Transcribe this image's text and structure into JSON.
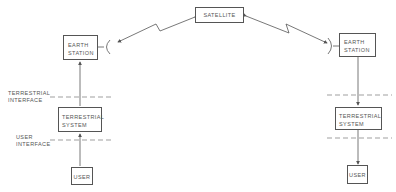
{
  "diagram": {
    "satellite": {
      "label": "SATELLITE"
    },
    "left": {
      "earth_station": {
        "line1": "EARTH",
        "line2": "STATION"
      },
      "terrestrial_interface": {
        "line1": "TERRESTRIAL",
        "line2": "INTERFACE"
      },
      "terrestrial_system": {
        "line1": "TERRESTRIAL",
        "line2": "SYSTEM"
      },
      "user_interface": {
        "line1": "USER",
        "line2": "INTERFACE"
      },
      "user": {
        "label": "USER"
      }
    },
    "right": {
      "earth_station": {
        "line1": "EARTH",
        "line2": "STATION"
      },
      "terrestrial_system": {
        "line1": "TERRESTRIAL",
        "line2": "SYSTEM"
      },
      "user": {
        "label": "USER"
      }
    }
  }
}
